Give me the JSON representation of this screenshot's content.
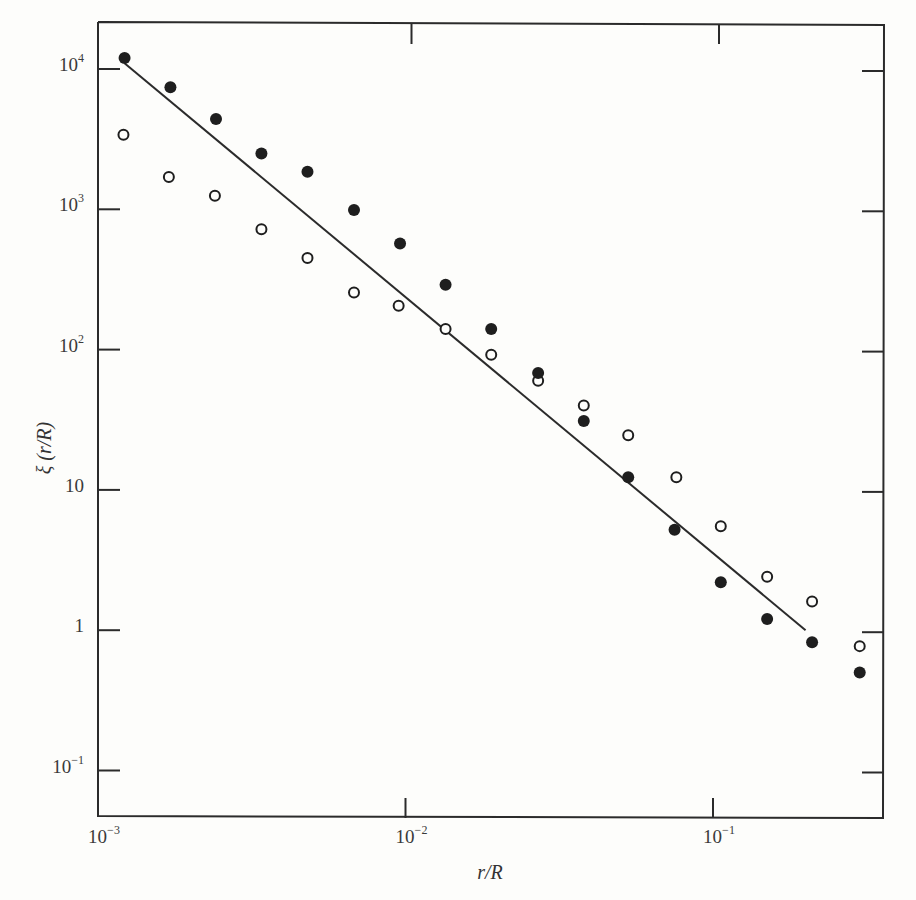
{
  "chart_data": {
    "type": "scatter",
    "title": "",
    "xlabel": "r/R",
    "ylabel": "ξ (r/R)",
    "xscale": "log",
    "yscale": "log",
    "xlim": [
      0.001,
      0.37
    ],
    "ylim": [
      0.045,
      30000
    ],
    "grid": false,
    "legend": "none",
    "x_ticks": [
      {
        "value": 0.001,
        "base": "10",
        "exp": "−3"
      },
      {
        "value": 0.01,
        "base": "10",
        "exp": "−2"
      },
      {
        "value": 0.1,
        "base": "10",
        "exp": "−1"
      }
    ],
    "y_ticks": [
      {
        "value": 10000,
        "base": "10",
        "exp": "4"
      },
      {
        "value": 1000,
        "base": "10",
        "exp": "3"
      },
      {
        "value": 100,
        "base": "10",
        "exp": "2"
      },
      {
        "value": 10,
        "base": "10",
        "exp": ""
      },
      {
        "value": 1,
        "base": "1",
        "exp": ""
      },
      {
        "value": 0.1,
        "base": "10",
        "exp": "−1"
      }
    ],
    "series": [
      {
        "name": "filled circles",
        "marker": "filled",
        "x": [
          0.00122,
          0.00172,
          0.00242,
          0.0034,
          0.0048,
          0.0068,
          0.0096,
          0.0135,
          0.019,
          0.027,
          0.038,
          0.053,
          0.075,
          0.106,
          0.15,
          0.21,
          0.3
        ],
        "y": [
          12000,
          7400,
          4400,
          2500,
          1850,
          990,
          570,
          290,
          140,
          68,
          31,
          12.3,
          5.2,
          2.2,
          1.2,
          0.82,
          0.5
        ]
      },
      {
        "name": "open circles",
        "marker": "open",
        "x": [
          0.00121,
          0.0017,
          0.0024,
          0.0034,
          0.0048,
          0.0068,
          0.0095,
          0.0135,
          0.019,
          0.027,
          0.038,
          0.053,
          0.076,
          0.106,
          0.15,
          0.21,
          0.3
        ],
        "y": [
          3400,
          1700,
          1250,
          720,
          450,
          255,
          205,
          140,
          92,
          60,
          40,
          24.5,
          12.3,
          5.5,
          2.4,
          1.6,
          0.77
        ]
      }
    ],
    "fit_line": {
      "name": "power-law fit",
      "x": [
        0.00122,
        0.2
      ],
      "y": [
        11000,
        1.0
      ]
    },
    "annotations": []
  },
  "axes": {
    "x_title": "r/R",
    "y_title": "ξ (r/R)"
  }
}
